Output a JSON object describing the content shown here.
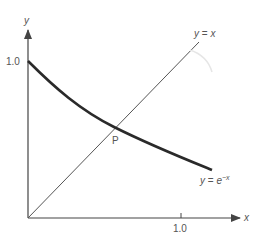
{
  "diagram": {
    "axes": {
      "x_label": "x",
      "y_label": "y",
      "x_tick_label": "1.0",
      "y_tick_label": "1.0"
    },
    "curves": [
      {
        "name": "line",
        "label_prefix": "y = ",
        "label_var": "x"
      },
      {
        "name": "exponential",
        "label_prefix": "y = e",
        "label_sup": "−x"
      }
    ],
    "intersection_label": "P",
    "colors": {
      "axis": "#444444",
      "line": "#555555",
      "curve": "#2a2a2a",
      "text": "#555555"
    }
  }
}
